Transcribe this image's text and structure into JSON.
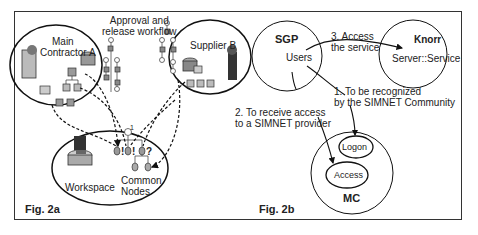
{
  "fig_a": {
    "caption": "Fig. 2a",
    "workflow_label_line1": "Approval and",
    "workflow_label_line2": "release workflow",
    "main_contractor_line1": "Main",
    "main_contractor_line2": "Contractor A",
    "supplier": "Supplier B",
    "workspace": "Workspace",
    "common_nodes_line1": "Common",
    "common_nodes_line2": "Nodes",
    "node_marks": [
      "!",
      "!",
      "?"
    ],
    "step_number": "1"
  },
  "fig_b": {
    "caption": "Fig. 2b",
    "sgp": "SGP",
    "users": "Users",
    "knorr": "Knorr",
    "server_service": "Server::Service",
    "mc": "MC",
    "logon": "Logon",
    "access": "Access",
    "step1_line1": "1. To be recognized",
    "step1_line2": "by the SIMNET Community",
    "step2_line1": "2. To receive access",
    "step2_line2": "to a SIMNET provider",
    "step3_line1": "3. Access",
    "step3_line2": "the service"
  }
}
